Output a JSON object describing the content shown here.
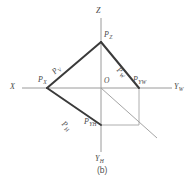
{
  "figure": {
    "caption": "(b)",
    "colors": {
      "axis": "#9a9a9a",
      "thin_line": "#a5a5a5",
      "bold_line": "#3a3a3a",
      "text": "#4a4a4a",
      "background": "#ffffff"
    },
    "axes": [
      {
        "id": "x-axis",
        "label": "X",
        "sub": "",
        "direction": "left"
      },
      {
        "id": "yw-axis",
        "label": "Y",
        "sub": "W",
        "direction": "right"
      },
      {
        "id": "z-axis",
        "label": "Z",
        "sub": "",
        "direction": "up"
      },
      {
        "id": "yh-axis",
        "label": "Y",
        "sub": "H",
        "direction": "down"
      }
    ],
    "origin_label": "O",
    "points": [
      {
        "id": "p-z",
        "label": "P",
        "sub": "Z",
        "x": 101,
        "y": 42
      },
      {
        "id": "p-x",
        "label": "P",
        "sub": "X",
        "x": 47,
        "y": 88
      },
      {
        "id": "p-yw",
        "label": "P",
        "sub": "YW",
        "x": 139,
        "y": 88
      },
      {
        "id": "p-yh",
        "label": "P",
        "sub": "YH",
        "x": 101,
        "y": 125
      }
    ],
    "edges": [
      {
        "id": "p-v",
        "label": "P",
        "sub": "V",
        "from": "p-x",
        "to": "p-z"
      },
      {
        "id": "p-w",
        "label": "P",
        "sub": "W",
        "from": "p-z",
        "to": "p-yw"
      },
      {
        "id": "p-h",
        "label": "P",
        "sub": "H",
        "from": "p-x",
        "to": "p-yh"
      }
    ]
  }
}
